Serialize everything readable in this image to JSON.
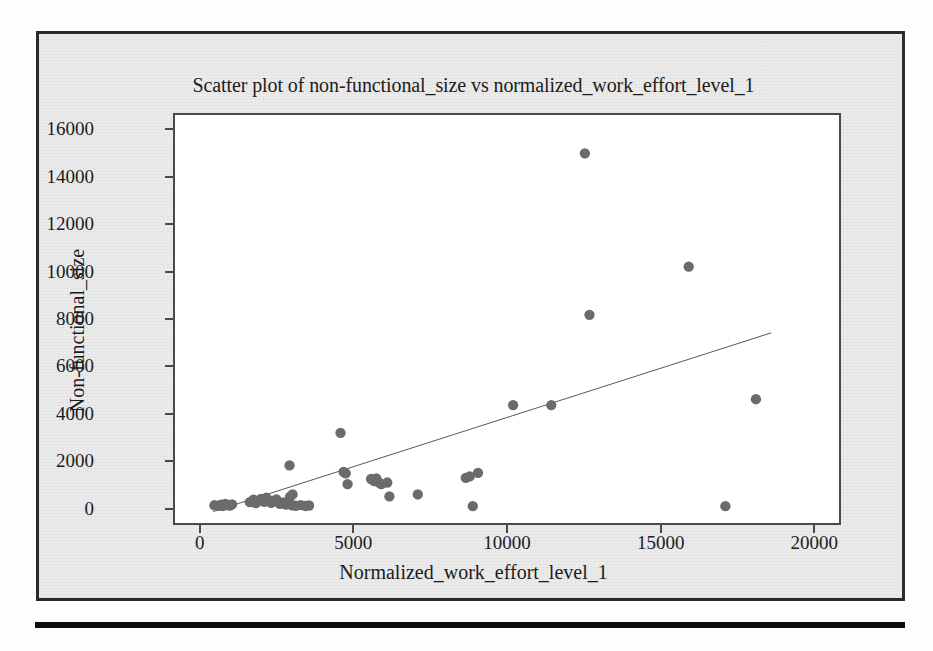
{
  "figure": {
    "title": "Scatter plot of non-functional_size vs normalized_work_effort_level_1",
    "x_axis_title": "Normalized_work_effort_level_1",
    "y_axis_title": "Non-functional_size",
    "marker_color": "#6b6b6b",
    "trendline_color": "#565656",
    "frame_color": "#4a4a4a",
    "panel_background": "#ebebeb",
    "plot_background": "#ffffff",
    "rule_color": "#0d0d0d"
  },
  "chart_data": {
    "type": "scatter",
    "title": "Scatter plot of non-functional_size vs normalized_work_effort_level_1",
    "xlabel": "Normalized_work_effort_level_1",
    "ylabel": "Non-functional_size",
    "xlim": [
      0,
      20000
    ],
    "ylim": [
      0,
      16000
    ],
    "xticks": [
      0,
      5000,
      10000,
      15000,
      20000
    ],
    "yticks": [
      0,
      2000,
      4000,
      6000,
      8000,
      10000,
      12000,
      14000,
      16000
    ],
    "xtick_labels": [
      "0",
      "5000",
      "10000",
      "15000",
      "20000"
    ],
    "ytick_labels": [
      "0",
      "2000",
      "4000",
      "6000",
      "8000",
      "10000",
      "12000",
      "14000",
      "16000"
    ],
    "grid": false,
    "legend": false,
    "axis_padding_fraction": 0.04,
    "series": [
      {
        "name": "non-functional_size",
        "marker": "circle",
        "color": "#6b6b6b",
        "x": [
          420,
          560,
          640,
          700,
          780,
          860,
          930,
          1000,
          1580,
          1700,
          1780,
          1860,
          1950,
          2050,
          2120,
          2200,
          2280,
          2360,
          2450,
          2560,
          2680,
          2760,
          2900,
          2960,
          3080,
          3250,
          3400,
          3520,
          2880,
          2980,
          4550,
          4650,
          4720,
          4780,
          5550,
          5650,
          5720,
          5800,
          5880,
          6080,
          6150,
          7080,
          8650,
          8780,
          8880,
          9050,
          10200,
          11450,
          12550,
          12700,
          15950,
          17150,
          18150
        ],
        "y": [
          60,
          40,
          90,
          30,
          120,
          70,
          50,
          100,
          190,
          300,
          150,
          260,
          330,
          210,
          380,
          280,
          160,
          240,
          310,
          120,
          180,
          90,
          430,
          60,
          40,
          70,
          30,
          50,
          1760,
          520,
          3150,
          1480,
          1420,
          960,
          1180,
          1090,
          1210,
          1040,
          960,
          1030,
          440,
          520,
          1230,
          1290,
          20,
          1440,
          4330,
          4330,
          15060,
          8180,
          10230,
          20,
          4580
        ]
      }
    ],
    "trendline": {
      "type": "linear",
      "x_start": 380,
      "y_start": -210,
      "x_end": 18650,
      "y_end": 7410,
      "color": "#565656",
      "width": 1
    },
    "n_points": 54
  }
}
